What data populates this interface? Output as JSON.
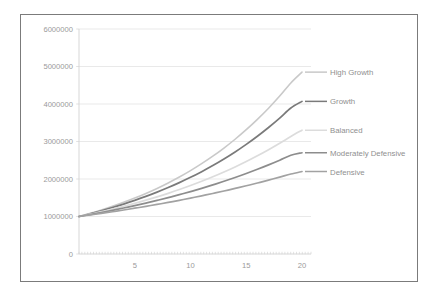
{
  "chart_data": {
    "type": "line",
    "title": "",
    "xlabel": "",
    "ylabel": "",
    "xlim": [
      0,
      23
    ],
    "ylim": [
      0,
      6000000
    ],
    "grid": true,
    "legend_position": "right-inline-labels",
    "x_ticks": [
      "5",
      "10",
      "15",
      "20"
    ],
    "x_tick_values": [
      5,
      10,
      15,
      20
    ],
    "y_ticks": [
      "0",
      "1000000",
      "2000000",
      "3000000",
      "4000000",
      "5000000",
      "6000000"
    ],
    "y_tick_values": [
      0,
      1000000,
      2000000,
      3000000,
      4000000,
      5000000,
      6000000
    ],
    "x": [
      0,
      1,
      2,
      3,
      4,
      5,
      6,
      7,
      8,
      9,
      10,
      11,
      12,
      13,
      14,
      15,
      16,
      17,
      18,
      19,
      20
    ],
    "series": [
      {
        "name": "High Growth",
        "color": "#c9c9c9",
        "width": 1.6,
        "values": [
          1000000,
          1083000,
          1173000,
          1271000,
          1377000,
          1491000,
          1615000,
          1749000,
          1895000,
          2052000,
          2223000,
          2408000,
          2608000,
          2825000,
          3060000,
          3314000,
          3590000,
          3888000,
          4211000,
          4562000,
          4850000
        ]
      },
      {
        "name": "Growth",
        "color": "#7a7a7a",
        "width": 1.7,
        "values": [
          1000000,
          1074000,
          1154000,
          1239000,
          1331000,
          1430000,
          1536000,
          1650000,
          1772000,
          1903000,
          2044000,
          2196000,
          2358000,
          2533000,
          2721000,
          2923000,
          3140000,
          3373000,
          3623000,
          3892000,
          4070000
        ]
      },
      {
        "name": "Balanced",
        "color": "#dcdcdc",
        "width": 1.7,
        "values": [
          1000000,
          1062000,
          1128000,
          1198000,
          1272000,
          1351000,
          1435000,
          1524000,
          1618000,
          1718000,
          1825000,
          1938000,
          2058000,
          2186000,
          2321000,
          2465000,
          2618000,
          2780000,
          2952000,
          3135000,
          3300000
        ]
      },
      {
        "name": "Moderately Defensive",
        "color": "#8d8d8d",
        "width": 1.7,
        "values": [
          1000000,
          1052000,
          1107000,
          1165000,
          1226000,
          1290000,
          1357000,
          1428000,
          1503000,
          1582000,
          1664000,
          1751000,
          1843000,
          1939000,
          2040000,
          2147000,
          2259000,
          2377000,
          2501000,
          2632000,
          2700000
        ]
      },
      {
        "name": "Defensive",
        "color": "#a2a2a2",
        "width": 1.7,
        "values": [
          1000000,
          1041000,
          1083000,
          1127000,
          1173000,
          1221000,
          1271000,
          1322000,
          1376000,
          1432000,
          1490000,
          1551000,
          1614000,
          1680000,
          1748000,
          1819000,
          1893000,
          1970000,
          2050000,
          2133000,
          2200000
        ]
      }
    ]
  },
  "legend": {
    "items": [
      {
        "label": "High Growth",
        "color": "#c9c9c9"
      },
      {
        "label": "Growth",
        "color": "#7a7a7a"
      },
      {
        "label": "Balanced",
        "color": "#dcdcdc"
      },
      {
        "label": "Moderately Defensive",
        "color": "#8d8d8d"
      },
      {
        "label": "Defensive",
        "color": "#a2a2a2"
      }
    ]
  },
  "style": {
    "frame_border_color": "#7b7b7b",
    "grid_color": "#e3e3e3",
    "tick_text_color": "#9a9a9a",
    "legend_text_color": "#8f8f8f",
    "background": "#ffffff"
  }
}
